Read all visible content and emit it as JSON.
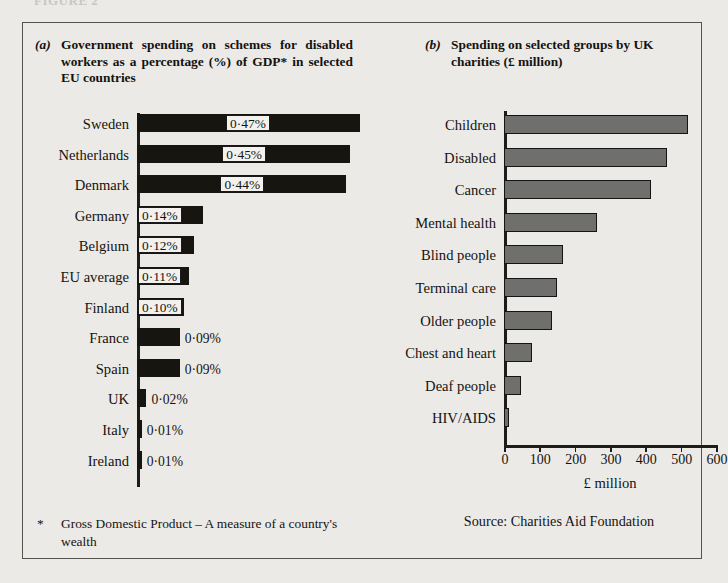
{
  "figure_caption": "FIGURE 2",
  "panel_a": {
    "label": "(a)",
    "title": "Government spending on schemes for disabled workers as a percentage (%) of GDP* in selected EU countries",
    "footnote_marker": "*",
    "footnote": "Gross Domestic Product – A measure of a country's wealth"
  },
  "panel_b": {
    "label": "(b)",
    "title": "Spending on selected groups by UK charities (£ million)",
    "source": "Source:  Charities Aid Foundation"
  },
  "colors": {
    "background": "#eceae7",
    "frame": "#56534f",
    "bar_a": "#17150f",
    "bar_b": "#6f6f6d",
    "bar_b_outline": "#141414",
    "text": "#15130f"
  },
  "chart_data": [
    {
      "type": "bar",
      "orientation": "horizontal",
      "id": "panel-a",
      "title": "Government spending on schemes for disabled workers as a percentage (%) of GDP* in selected EU countries",
      "xlabel": "",
      "ylabel": "",
      "xlim": [
        0,
        0.5
      ],
      "grid": false,
      "legend": "none",
      "unit": "% of GDP",
      "categories": [
        "Sweden",
        "Netherlands",
        "Denmark",
        "Germany",
        "Belgium",
        "EU average",
        "Finland",
        "France",
        "Spain",
        "UK",
        "Italy",
        "Ireland"
      ],
      "values": [
        0.47,
        0.45,
        0.44,
        0.14,
        0.12,
        0.11,
        0.1,
        0.09,
        0.09,
        0.02,
        0.01,
        0.01
      ],
      "data_labels": [
        "0·47%",
        "0·45%",
        "0·44%",
        "0·14%",
        "0·12%",
        "0·11%",
        "0·10%",
        "0·09%",
        "0·09%",
        "0·02%",
        "0·01%",
        "0·01%"
      ],
      "label_placement": [
        "inside",
        "inside",
        "inside",
        "inside",
        "inside",
        "inside",
        "inside",
        "outside",
        "outside",
        "outside",
        "outside",
        "outside"
      ]
    },
    {
      "type": "bar",
      "orientation": "horizontal",
      "id": "panel-b",
      "title": "Spending on selected groups by UK charities (£ million)",
      "xlabel": "£ million",
      "ylabel": "",
      "xlim": [
        0,
        600
      ],
      "xticks": [
        0,
        100,
        200,
        300,
        400,
        500,
        600
      ],
      "xtick_labels": [
        "0",
        "100",
        "200",
        "300",
        "400",
        "500",
        "600"
      ],
      "grid": false,
      "legend": "none",
      "unit": "£ million",
      "categories": [
        "Children",
        "Disabled",
        "Cancer",
        "Mental health",
        "Blind people",
        "Terminal care",
        "Older people",
        "Chest and heart",
        "Deaf people",
        "HIV/AIDS"
      ],
      "values": [
        520,
        460,
        417,
        263,
        166,
        149,
        137,
        80,
        49,
        13
      ]
    }
  ]
}
